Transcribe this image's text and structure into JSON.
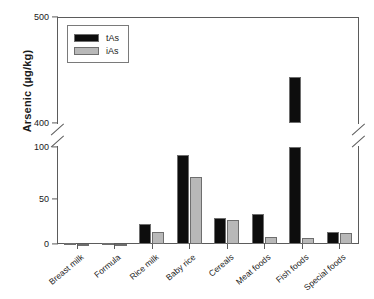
{
  "chart_data": {
    "type": "bar",
    "title": "",
    "xlabel": "",
    "ylabel": "Arsenic (µg/kg)",
    "categories": [
      "Breast milk",
      "Formula",
      "Rice milk",
      "Baby rice",
      "Cereals",
      "Meat foods",
      "Fish foods",
      "Special foods"
    ],
    "series": [
      {
        "name": "tAs",
        "color": "#0d0d0d",
        "values": [
          1,
          1,
          21,
          92,
          27,
          31,
          443,
          12
        ]
      },
      {
        "name": "iAs",
        "color": "#b8b8b8",
        "values": [
          0.5,
          0.5,
          12,
          69,
          25,
          7,
          6,
          11
        ]
      }
    ],
    "y_ticks": [
      "500",
      "400",
      "100",
      "50",
      "0"
    ],
    "ylim_lower": [
      0,
      100
    ],
    "ylim_upper": [
      400,
      500
    ],
    "axis_break": true,
    "axis_break_between": [
      100,
      400
    ],
    "grid": false,
    "legend_position": "top-left",
    "legend_entries": [
      "tAs",
      "iAs"
    ]
  },
  "axis": {
    "y_title": "Arsenic (µg/kg)",
    "ticks": [
      {
        "label": "500",
        "y": 17
      },
      {
        "label": "400",
        "y": 123
      },
      {
        "label": "100",
        "y": 147
      },
      {
        "label": "50",
        "y": 199
      },
      {
        "label": "0",
        "y": 244
      }
    ]
  },
  "legend": {
    "items": [
      {
        "label": "tAs",
        "fill": "#0d0d0d"
      },
      {
        "label": "iAs",
        "fill": "#b8b8b8"
      }
    ]
  }
}
